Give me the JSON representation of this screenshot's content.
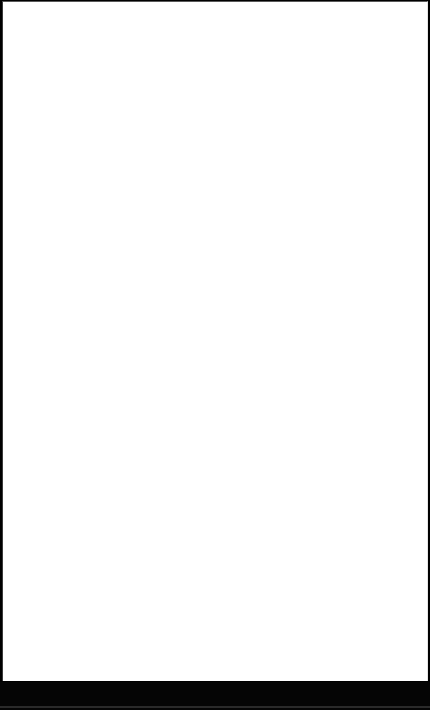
{
  "screen": {
    "width": 430,
    "height": 710,
    "state": "blank"
  },
  "viewport": {
    "background_color": "#ffffff",
    "content_text": ""
  },
  "bottom_bar": {
    "background_color": "#050505",
    "label": ""
  }
}
